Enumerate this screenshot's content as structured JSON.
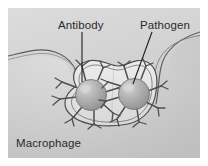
{
  "figure": {
    "kind": "biology-illustration",
    "background_color": "#ffffff",
    "panel_color": "#d2d2d2",
    "ink_color": "#3a3a3a",
    "labels": {
      "antibody": "Antibody",
      "pathogen": "Pathogen",
      "macrophage": "Macrophage"
    },
    "structures": {
      "pathogen_count": 2,
      "pathogen_fill": "#a9a9a9",
      "pathogen_highlight": "#cfcfcf",
      "membrane_color": "#e4e4e4",
      "membrane_outline": "#4a4a4a",
      "antibody_color": "#555555"
    },
    "leader_lines": {
      "antibody": "vertical",
      "pathogen": "diagonal"
    }
  }
}
